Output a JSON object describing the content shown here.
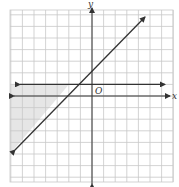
{
  "chart_data": {
    "type": "line",
    "title": "",
    "xlabel": "x",
    "ylabel": "y",
    "origin_label": "O",
    "xlim": [
      -7,
      7
    ],
    "ylim": [
      -7.4,
      7.4
    ],
    "grid": true,
    "grid_unit": 1,
    "series": [
      {
        "name": "boundary line y = x + 2",
        "kind": "line",
        "slope": 1,
        "intercept": 2,
        "style": "solid",
        "arrows": "both",
        "from": [
          -6.6,
          -4.6
        ],
        "to": [
          4.6,
          6.6
        ]
      },
      {
        "name": "boundary line y = 1",
        "kind": "line",
        "slope": 0,
        "intercept": 1,
        "style": "solid",
        "arrows": "both",
        "from": [
          -6.2,
          1
        ],
        "to": [
          6.2,
          1
        ]
      }
    ],
    "shaded_region": {
      "description": "region where y <= 1 and y >= x + 2",
      "vertices": [
        [
          -7,
          1
        ],
        [
          -1,
          1
        ],
        [
          -7,
          -5
        ]
      ],
      "color": "#e6e6e6"
    }
  },
  "labels": {
    "x_axis": "x",
    "y_axis": "y",
    "origin": "O"
  },
  "colors": {
    "grid": "#c8c8c8",
    "axis": "#333333",
    "shade": "#e6e6e6"
  }
}
